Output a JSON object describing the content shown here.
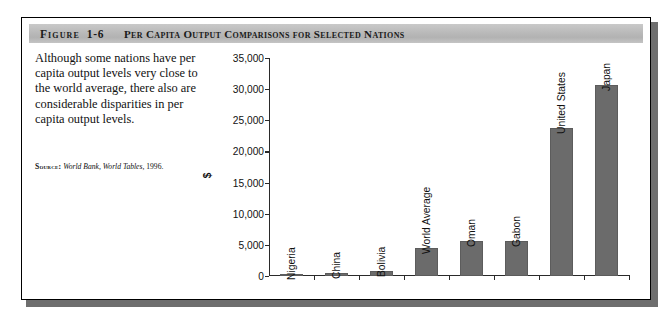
{
  "figure": {
    "label": "Figure",
    "number": "1-6",
    "title": "Per Capita Output Comparisons for Selected Nations"
  },
  "caption": {
    "text": "Although some nations have per capita output levels very close to the world average, there also are considerable disparities in per capita output levels."
  },
  "source": {
    "label": "Source:",
    "reference": "World Bank, World Tables,",
    "year": "1996."
  },
  "colors": {
    "bar_fill": "#6b6b6b",
    "band_gray": "#bdbdbd",
    "frame": "#000000",
    "axis": "#2a2a2a"
  },
  "chart_data": {
    "type": "bar",
    "title": "Per Capita Output Comparisons for Selected Nations",
    "xlabel": "",
    "ylabel": "$",
    "categories": [
      "Nigeria",
      "China",
      "Bolivia",
      "World Average",
      "Oman",
      "Gabon",
      "United States",
      "Japan"
    ],
    "values": [
      300,
      500,
      800,
      4500,
      5600,
      5600,
      23800,
      30700
    ],
    "ylim": [
      0,
      35000
    ],
    "ytick_values": [
      0,
      5000,
      10000,
      15000,
      20000,
      25000,
      30000,
      35000
    ],
    "ytick_labels": [
      "0",
      "5,000",
      "10,000",
      "15,000",
      "20,000",
      "25,000",
      "30,000",
      "35,000"
    ],
    "grid": false,
    "legend": false
  }
}
